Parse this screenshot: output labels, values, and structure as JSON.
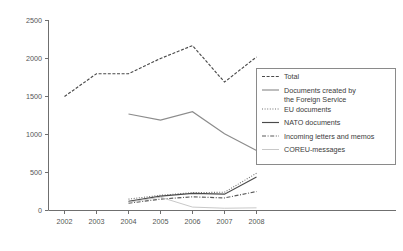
{
  "chart_data": {
    "type": "line",
    "title": "",
    "subtitle": "",
    "xlabel": "",
    "ylabel": "",
    "categories": [
      "2002",
      "2003",
      "2004",
      "2005",
      "2006",
      "2007",
      "2008"
    ],
    "x": [
      2002,
      2003,
      2004,
      2005,
      2006,
      2007,
      2008
    ],
    "xlim": [
      2001.5,
      2008.5
    ],
    "ylim": [
      0,
      2500
    ],
    "yticks": [
      0,
      500,
      1000,
      1500,
      2000,
      2500
    ],
    "ytick_labels": [
      "0",
      "500",
      "1000",
      "1500",
      "2000",
      "2500"
    ],
    "grid": false,
    "legend_position": "right",
    "series": [
      {
        "name": "Total",
        "style": "dashed",
        "color": "#4a4a4a",
        "x": [
          2002,
          2003,
          2004,
          2005,
          2006,
          2007,
          2008
        ],
        "values": [
          1500,
          1800,
          1800,
          2000,
          2170,
          1690,
          2020
        ]
      },
      {
        "name": "Documents created by the Foreign Service",
        "style": "solid",
        "color": "#8c8c8c",
        "x": [
          2004,
          2005,
          2006,
          2007,
          2008
        ],
        "values": [
          1270,
          1190,
          1300,
          1010,
          790
        ]
      },
      {
        "name": "EU documents",
        "style": "dotted",
        "color": "#707070",
        "x": [
          2004,
          2005,
          2006,
          2007,
          2008
        ],
        "values": [
          150,
          200,
          235,
          240,
          490
        ]
      },
      {
        "name": "NATO documents",
        "style": "solid",
        "color": "#4a4a4a",
        "x": [
          2004,
          2005,
          2006,
          2007,
          2008
        ],
        "values": [
          120,
          190,
          225,
          215,
          440
        ]
      },
      {
        "name": "Incoming letters and memos",
        "style": "dashdot",
        "color": "#5a5a5a",
        "x": [
          2004,
          2005,
          2006,
          2007,
          2008
        ],
        "values": [
          95,
          150,
          180,
          165,
          250
        ]
      },
      {
        "name": "COREU-messages",
        "style": "solid-light",
        "color": "#c2c2c2",
        "x": [
          2004,
          2005,
          2006,
          2007,
          2008
        ],
        "values": [
          110,
          175,
          45,
          30,
          35
        ]
      }
    ]
  },
  "legend": {
    "items": [
      {
        "label": "Total",
        "style": "dashed"
      },
      {
        "label": "Documents created by",
        "label2": "the Foreign Service",
        "style": "solid"
      },
      {
        "label": "EU documents",
        "style": "dotted"
      },
      {
        "label": "NATO documents",
        "style": "solid"
      },
      {
        "label": "Incoming letters and memos",
        "style": "dashdot"
      },
      {
        "label": "COREU-messages",
        "style": "solid-light"
      }
    ]
  },
  "axes": {
    "y_tick_labels": [
      "2500",
      "2000",
      "1500",
      "1000",
      "500",
      "0"
    ],
    "x_tick_labels": [
      "2002",
      "2003",
      "2004",
      "2005",
      "2006",
      "2007",
      "2008"
    ]
  }
}
